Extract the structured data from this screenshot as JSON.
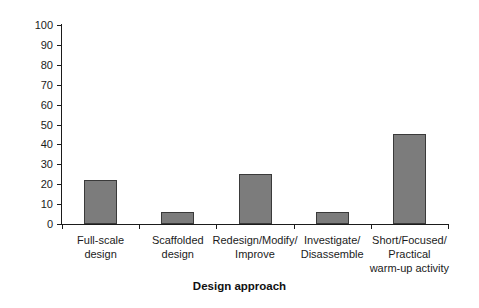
{
  "chart_data": {
    "type": "bar",
    "title": "",
    "xlabel": "Design approach",
    "ylabel": "",
    "categories": [
      "Full-scale\ndesign",
      "Scaffolded\ndesign",
      "Redesign/Modify/\nImprove",
      "Investigate/\nDisassemble",
      "Short/Focused/\nPractical\nwarm-up activity"
    ],
    "category_lines": [
      [
        "Full-scale",
        "design"
      ],
      [
        "Scaffolded",
        "design"
      ],
      [
        "Redesign/Modify/",
        "Improve"
      ],
      [
        "Investigate/",
        "Disassemble"
      ],
      [
        "Short/Focused/",
        "Practical",
        "warm-up activity"
      ]
    ],
    "values": [
      22,
      6,
      25,
      6,
      45
    ],
    "ylim": [
      0,
      100
    ],
    "ytick_step": 10,
    "yticks": [
      0,
      10,
      20,
      30,
      40,
      50,
      60,
      70,
      80,
      90,
      100
    ],
    "ytick_labels": [
      "0",
      "10",
      "20",
      "30",
      "40",
      "50",
      "60",
      "70",
      "80",
      "90",
      "100"
    ],
    "grid": false,
    "legend": null,
    "bar_color": "#7c7c7c",
    "bar_border_color": "#3a3a3a",
    "axis_color": "#1b1b1b",
    "background_color": "#ffffff"
  }
}
